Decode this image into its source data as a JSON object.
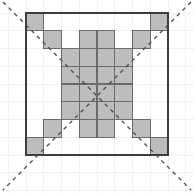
{
  "figure": {
    "type": "geometric-diagram",
    "canvas": {
      "width": 194,
      "height": 193
    },
    "background_color": "#ffffff",
    "grid": {
      "visible": true,
      "origin_x": 26,
      "origin_y": 13,
      "cell_size": 17.75,
      "cols": 8,
      "rows": 8,
      "background_grid_color": "#f2f2f2",
      "background_grid_stroke": 1,
      "cell_line_color": "#5a5a5a",
      "cell_line_stroke": 1.2,
      "border_color": "#3d3d3d",
      "border_stroke": 1.4
    },
    "shaded_cells": {
      "fill_color": "#bdbdbd",
      "stroke_color": "#6b6b6b",
      "stroke_width": 1.2,
      "label": "shaded square cells",
      "coords": [
        [
          0,
          0
        ],
        [
          1,
          1
        ],
        [
          7,
          0
        ],
        [
          6,
          1
        ],
        [
          0,
          7
        ],
        [
          1,
          6
        ],
        [
          7,
          7
        ],
        [
          6,
          6
        ],
        [
          3,
          1
        ],
        [
          4,
          1
        ],
        [
          2,
          2
        ],
        [
          3,
          2
        ],
        [
          4,
          2
        ],
        [
          5,
          2
        ],
        [
          2,
          3
        ],
        [
          3,
          3
        ],
        [
          4,
          3
        ],
        [
          5,
          3
        ],
        [
          2,
          4
        ],
        [
          3,
          4
        ],
        [
          4,
          4
        ],
        [
          5,
          4
        ],
        [
          2,
          5
        ],
        [
          3,
          5
        ],
        [
          4,
          5
        ],
        [
          5,
          5
        ],
        [
          3,
          6
        ],
        [
          4,
          6
        ]
      ]
    },
    "diagonals": {
      "label": "dashed diagonal symmetry axes",
      "color": "#4a4a4a",
      "stroke_width": 1.3,
      "dash_pattern": "4 4",
      "lines": [
        {
          "name": "diagonal-nw-se",
          "x1": 3,
          "y1": 2,
          "x2": 191,
          "y2": 190
        },
        {
          "name": "diagonal-ne-sw",
          "x1": 191,
          "y1": 2,
          "x2": 3,
          "y2": 190
        }
      ]
    },
    "inner_lines": {
      "label": "internal cell separators of shaded regions",
      "color": "#5a5a5a",
      "stroke_width": 1.2
    },
    "caption": ""
  }
}
